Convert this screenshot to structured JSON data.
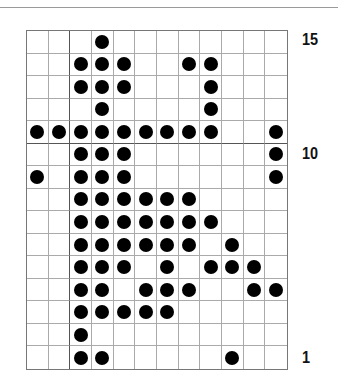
{
  "chart": {
    "columns": 12,
    "rows": 15,
    "thick_vertical_after_col": 2,
    "thick_horizontal_between_rows": [
      11,
      10
    ],
    "dot_color": "#000000",
    "row_labels": [
      {
        "row": 15,
        "text": "15"
      },
      {
        "row": 10,
        "text": "10"
      },
      {
        "row": 1,
        "text": "1"
      }
    ],
    "filled": {
      "15": [
        4
      ],
      "14": [
        3,
        4,
        5,
        8,
        9
      ],
      "13": [
        3,
        4,
        5,
        9
      ],
      "12": [
        4,
        9
      ],
      "11": [
        1,
        2,
        3,
        4,
        5,
        6,
        7,
        8,
        9,
        12
      ],
      "10": [
        3,
        4,
        5,
        12
      ],
      "9": [
        1,
        3,
        4,
        5,
        12
      ],
      "8": [
        3,
        4,
        5,
        6,
        7,
        8
      ],
      "7": [
        3,
        4,
        5,
        6,
        7,
        8,
        9
      ],
      "6": [
        3,
        4,
        5,
        6,
        7,
        8,
        10
      ],
      "5": [
        3,
        4,
        5,
        7,
        9,
        10,
        11
      ],
      "4": [
        3,
        4,
        6,
        7,
        8,
        11,
        12
      ],
      "3": [
        3,
        4,
        5,
        6,
        7
      ],
      "2": [
        3
      ],
      "1": [
        3,
        4,
        10
      ]
    }
  }
}
